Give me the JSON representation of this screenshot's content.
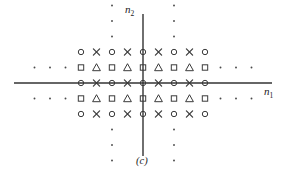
{
  "figure": {
    "panel_label": "(c)",
    "caption_id": "c",
    "axes": {
      "x_label_text": "n",
      "x_label_sub": "1",
      "y_label_text": "n",
      "y_label_sub": "2",
      "x_axis_name": "n1",
      "y_axis_name": "n2",
      "origin_px": [
        143,
        83
      ],
      "x_line_from": 14,
      "x_line_to": 272,
      "y_line_from": 14,
      "y_line_to": 156,
      "color": "#333333",
      "line_width": 1.4
    },
    "grid": {
      "spacing_px": 15.5,
      "origin_x": 143,
      "origin_y": 83,
      "col_min": -4,
      "col_max": 4,
      "row_min": -2,
      "row_max": 2
    },
    "symbol_color": "#3a3a3a",
    "dot_color": "#4a4a4a",
    "legend_symbols": [
      "circle",
      "cross",
      "square",
      "triangle",
      "dot"
    ]
  },
  "chart_data": {
    "type": "scatter",
    "title": "",
    "subtitle": "(c)",
    "xlabel": "n1",
    "ylabel": "n2",
    "xlim": [
      -4.8,
      4.8
    ],
    "ylim": [
      -2.8,
      2.8
    ],
    "grid": false,
    "legend": "none",
    "marker_legend": {
      "circle": "coset A (n1 even, n2 even)",
      "cross": "coset B (n1 odd, n2 even)",
      "square": "coset C (n1 even, n2 odd)",
      "triangle": "coset D (n1 odd, n2 odd)",
      "dot": "lattice continuation"
    },
    "series": [
      {
        "name": "circle",
        "marker": "circle",
        "points": [
          [
            -4,
            2
          ],
          [
            -2,
            2
          ],
          [
            0,
            2
          ],
          [
            2,
            2
          ],
          [
            4,
            2
          ],
          [
            -4,
            0
          ],
          [
            -2,
            0
          ],
          [
            0,
            0
          ],
          [
            2,
            0
          ],
          [
            4,
            0
          ],
          [
            -4,
            -2
          ],
          [
            -2,
            -2
          ],
          [
            0,
            -2
          ],
          [
            2,
            -2
          ],
          [
            4,
            -2
          ]
        ]
      },
      {
        "name": "cross",
        "marker": "cross",
        "points": [
          [
            -3,
            2
          ],
          [
            -1,
            2
          ],
          [
            1,
            2
          ],
          [
            3,
            2
          ],
          [
            -3,
            0
          ],
          [
            -1,
            0
          ],
          [
            1,
            0
          ],
          [
            3,
            0
          ],
          [
            -3,
            -2
          ],
          [
            -1,
            -2
          ],
          [
            1,
            -2
          ],
          [
            3,
            -2
          ]
        ]
      },
      {
        "name": "square",
        "marker": "square",
        "points": [
          [
            -4,
            1
          ],
          [
            -2,
            1
          ],
          [
            0,
            1
          ],
          [
            2,
            1
          ],
          [
            4,
            1
          ],
          [
            -4,
            -1
          ],
          [
            -2,
            -1
          ],
          [
            0,
            -1
          ],
          [
            2,
            -1
          ],
          [
            4,
            -1
          ]
        ]
      },
      {
        "name": "triangle",
        "marker": "triangle",
        "points": [
          [
            -3,
            1
          ],
          [
            -1,
            1
          ],
          [
            1,
            1
          ],
          [
            3,
            1
          ],
          [
            -3,
            -1
          ],
          [
            -1,
            -1
          ],
          [
            1,
            -1
          ],
          [
            3,
            -1
          ]
        ]
      },
      {
        "name": "dot",
        "marker": "dot",
        "points": [
          [
            -7,
            1
          ],
          [
            -6,
            1
          ],
          [
            -5,
            1
          ],
          [
            -7,
            -1
          ],
          [
            -6,
            -1
          ],
          [
            -5,
            -1
          ],
          [
            5,
            1
          ],
          [
            6,
            1
          ],
          [
            7,
            1
          ],
          [
            5,
            -1
          ],
          [
            6,
            -1
          ],
          [
            7,
            -1
          ],
          [
            -2,
            3
          ],
          [
            -2,
            4
          ],
          [
            -2,
            5
          ],
          [
            2,
            3
          ],
          [
            2,
            4
          ],
          [
            2,
            5
          ],
          [
            -2,
            -3
          ],
          [
            -2,
            -4
          ],
          [
            -2,
            -5
          ],
          [
            2,
            -3
          ],
          [
            2,
            -4
          ],
          [
            2,
            -5
          ]
        ]
      }
    ]
  }
}
